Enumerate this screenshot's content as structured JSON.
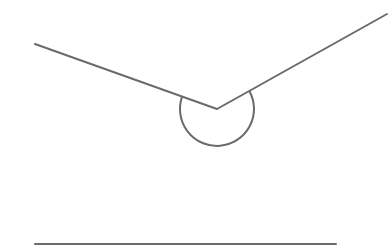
{
  "diagram": {
    "type": "reflex-angle",
    "stroke_color": "#6a6a6a",
    "stroke_width": 2,
    "vertex": {
      "x": 217,
      "y": 109
    },
    "rays": [
      {
        "name": "left-ray",
        "from": {
          "x": 217,
          "y": 109
        },
        "to": {
          "x": 35,
          "y": 44
        }
      },
      {
        "name": "right-ray",
        "from": {
          "x": 217,
          "y": 109
        },
        "to": {
          "x": 387,
          "y": 14
        }
      }
    ],
    "angle_arc": {
      "center": {
        "x": 217,
        "y": 109
      },
      "radius": 37,
      "start": {
        "x": 182.1,
        "y": 96.6
      },
      "end": {
        "x": 249.3,
        "y": 90.9
      },
      "marks": "reflex angle (below vertex)"
    },
    "baseline": {
      "from": {
        "x": 35,
        "y": 244
      },
      "to": {
        "x": 336,
        "y": 244
      }
    }
  }
}
